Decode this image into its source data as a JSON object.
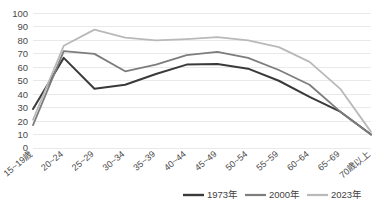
{
  "chart_data": {
    "type": "line",
    "title": "",
    "xlabel": "",
    "ylabel": "",
    "ylim": [
      0,
      100
    ],
    "ytick_step": 10,
    "grid": true,
    "legend_position": "bottom-right",
    "yticks": [
      "0",
      "10",
      "20",
      "30",
      "40",
      "50",
      "60",
      "70",
      "80",
      "90",
      "100"
    ],
    "categories": [
      "15~19歳",
      "20~24",
      "25~29",
      "30~34",
      "35~39",
      "40~44",
      "45~49",
      "50~54",
      "55~59",
      "60~64",
      "65~69",
      "70歳以上"
    ],
    "series": [
      {
        "name": "1973年",
        "color": "#3a3a3a",
        "width": 2.0,
        "values": [
          29,
          67,
          44,
          47,
          55,
          62,
          62.5,
          59,
          50,
          38,
          27,
          10
        ]
      },
      {
        "name": "2000年",
        "color": "#7d7d7d",
        "width": 1.8,
        "values": [
          17,
          72,
          70,
          57,
          62,
          69,
          71.5,
          67,
          58,
          47,
          27,
          10
        ]
      },
      {
        "name": "2023年",
        "color": "#b9b9b9",
        "width": 1.8,
        "values": [
          21,
          76,
          88,
          82,
          80,
          81,
          82.5,
          80,
          75,
          64,
          44,
          12
        ]
      }
    ]
  },
  "colors": {
    "background": "#ffffff",
    "gridline": "#e4e4e4",
    "text": "#3f3f3f"
  }
}
